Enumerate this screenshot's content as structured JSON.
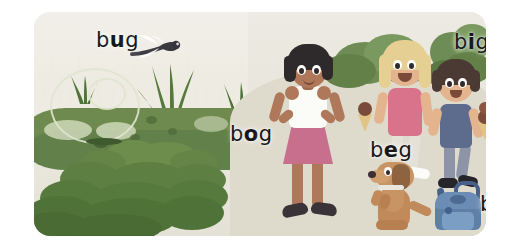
{
  "card": {
    "background_color": "#efede7",
    "border_radius_px": 16
  },
  "labels": [
    {
      "id": "bug",
      "prefix": "b",
      "vowel": "u",
      "suffix": "g",
      "full": "bug",
      "x": 62,
      "y": 16
    },
    {
      "id": "bog",
      "prefix": "b",
      "vowel": "o",
      "suffix": "g",
      "full": "bog",
      "x": 196,
      "y": 110
    },
    {
      "id": "beg",
      "prefix": "b",
      "vowel": "e",
      "suffix": "g",
      "full": "beg",
      "x": 336,
      "y": 126
    },
    {
      "id": "big",
      "prefix": "b",
      "vowel": "i",
      "suffix": "g",
      "full": "big",
      "x": 420,
      "y": 18
    },
    {
      "id": "bag",
      "prefix": "b",
      "vowel": "a",
      "suffix": "g",
      "full": "bag",
      "x": 446,
      "y": 180
    }
  ],
  "scene": {
    "left": {
      "name": "bog-swamp",
      "sky_color": "#efede4",
      "water_color": "#6f8a4e",
      "reed_color": "#e9e7dc",
      "bush_color": "#6b8a4a",
      "dragonfly_color": "#3a3a40"
    },
    "right": {
      "name": "park",
      "ground_color": "#e8e5da",
      "hill_color": "#dedbcd",
      "tree_color": "#6e8c55",
      "girl": {
        "name": "girl-hands-on-hips",
        "hair_color": "#2e2a2c",
        "skin_color": "#b0785a",
        "top_color": "#fbfbf7",
        "skirt_color": "#c96f8e",
        "shoe_color": "#3a3338"
      },
      "kid_blonde": {
        "name": "blonde-girl-with-ice-cream",
        "hair_color": "#e6cf92",
        "skin_color": "#e3b48e",
        "shirt_color": "#d9738b",
        "pants_color": "#e4e1d6",
        "ice_cream_color": "#7a4b3a"
      },
      "kid_brown": {
        "name": "brown-hair-boy-with-ice-cream",
        "hair_color": "#4a3a33",
        "skin_color": "#e3b48e",
        "shirt_color": "#5d6b8c",
        "pants_color": "#8e94a8",
        "shoe_color": "#26252a"
      },
      "dog": {
        "name": "begging-dog",
        "body_color": "#c08a5a",
        "ear_color": "#8d6340",
        "collar_color": "#e8e6df"
      },
      "backpack": {
        "name": "blue-backpack",
        "body_color": "#5e7fa8",
        "pocket_color": "#7b9ec4",
        "strap_color": "#47618a"
      }
    }
  }
}
